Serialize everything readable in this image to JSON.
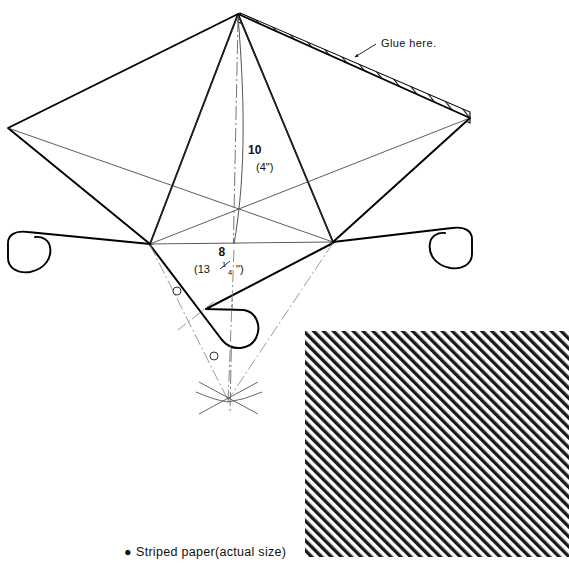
{
  "figure": {
    "type": "technical-drawing"
  },
  "annotations": {
    "glue_note": "Glue here.",
    "height_value": "10",
    "height_alt": "(4\")",
    "width_value": "8",
    "width_alt_prefix": "(13",
    "width_alt_frac_num": "1",
    "width_alt_frac_den": "4",
    "width_alt_suffix": "\")",
    "width_alt_full": "(13 1/4\")"
  },
  "caption": {
    "bullet": "●",
    "text": "Striped paper(actual size)"
  },
  "swatch": {
    "label": "striped-paper-swatch",
    "stripe_angle_deg": 45,
    "stripe_period_px": 7,
    "stripe_color": "#1a1a1a",
    "background_color": "#ffffff",
    "bounds": {
      "x": 305,
      "y": 331,
      "width": 264,
      "height": 226
    }
  },
  "colors": {
    "ink": "#111111",
    "outline": "#000000",
    "thin_line": "#555555",
    "construction_line": "#777777",
    "paper": "#ffffff"
  },
  "geometry": {
    "apex": {
      "x": 238,
      "y": 14
    },
    "left_corner": {
      "x": 8,
      "y": 128
    },
    "right_corner": {
      "x": 470,
      "y": 118
    },
    "left_spar": {
      "x": 150,
      "y": 244
    },
    "right_spar": {
      "x": 333,
      "y": 242
    },
    "bridle_point": {
      "x": 228,
      "y": 400
    },
    "bridle_markers": [
      {
        "x": 177,
        "y": 291
      },
      {
        "x": 214,
        "y": 356
      }
    ]
  }
}
